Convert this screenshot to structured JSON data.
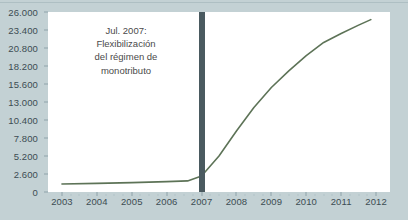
{
  "chart_data": {
    "type": "line",
    "title": "",
    "subtitle": "",
    "xlabel": "",
    "ylabel": "",
    "xlim": [
      2002.6,
      2012.4
    ],
    "ylim": [
      0,
      26000
    ],
    "grid": false,
    "legend": "none",
    "y_ticks": [
      0,
      2600,
      5200,
      7800,
      10400,
      13000,
      15600,
      18200,
      20800,
      23400,
      26000
    ],
    "y_tick_labels": [
      "0",
      "2.600",
      "5.200",
      "7.800",
      "10.400",
      "13.000",
      "15.600",
      "18.200",
      "20.800",
      "23.400",
      "26.000"
    ],
    "x_ticks": [
      2003,
      2004,
      2005,
      2006,
      2007,
      2008,
      2009,
      2010,
      2011,
      2012
    ],
    "x_tick_labels": [
      "2003",
      "2004",
      "2005",
      "2006",
      "2007",
      "2008",
      "2009",
      "2010",
      "2011",
      "2012"
    ],
    "series": [
      {
        "name": "monotributistas",
        "color": "#5d7357",
        "x": [
          2003.0,
          2004.0,
          2005.0,
          2006.0,
          2006.6,
          2007.0,
          2007.5,
          2008.0,
          2008.5,
          2009.0,
          2009.5,
          2010.0,
          2010.5,
          2011.0,
          2011.5,
          2011.85
        ],
        "values": [
          1150,
          1250,
          1350,
          1500,
          1600,
          2300,
          5200,
          8800,
          12200,
          15100,
          17500,
          19700,
          21600,
          22900,
          24100,
          24900
        ]
      }
    ],
    "annotations": [
      {
        "name": "event-marker",
        "type": "vertical-line",
        "x": 2007.0,
        "color": "#4a5a60",
        "label_lines": [
          "Jul. 2007:",
          "Flexibilización",
          "del régimen de",
          "monotributo"
        ]
      }
    ],
    "colors": {
      "background": "#c3d1d4",
      "plot_background": "#ffffff",
      "line": "#5d7357",
      "marker": "#4a5a60",
      "tick_text": "#3c4c52",
      "annotation_text": "#4a4a4a"
    }
  },
  "annotation": {
    "line1": "Jul. 2007:",
    "line2": "Flexibilización",
    "line3": "del régimen de",
    "line4": "monotributo"
  }
}
